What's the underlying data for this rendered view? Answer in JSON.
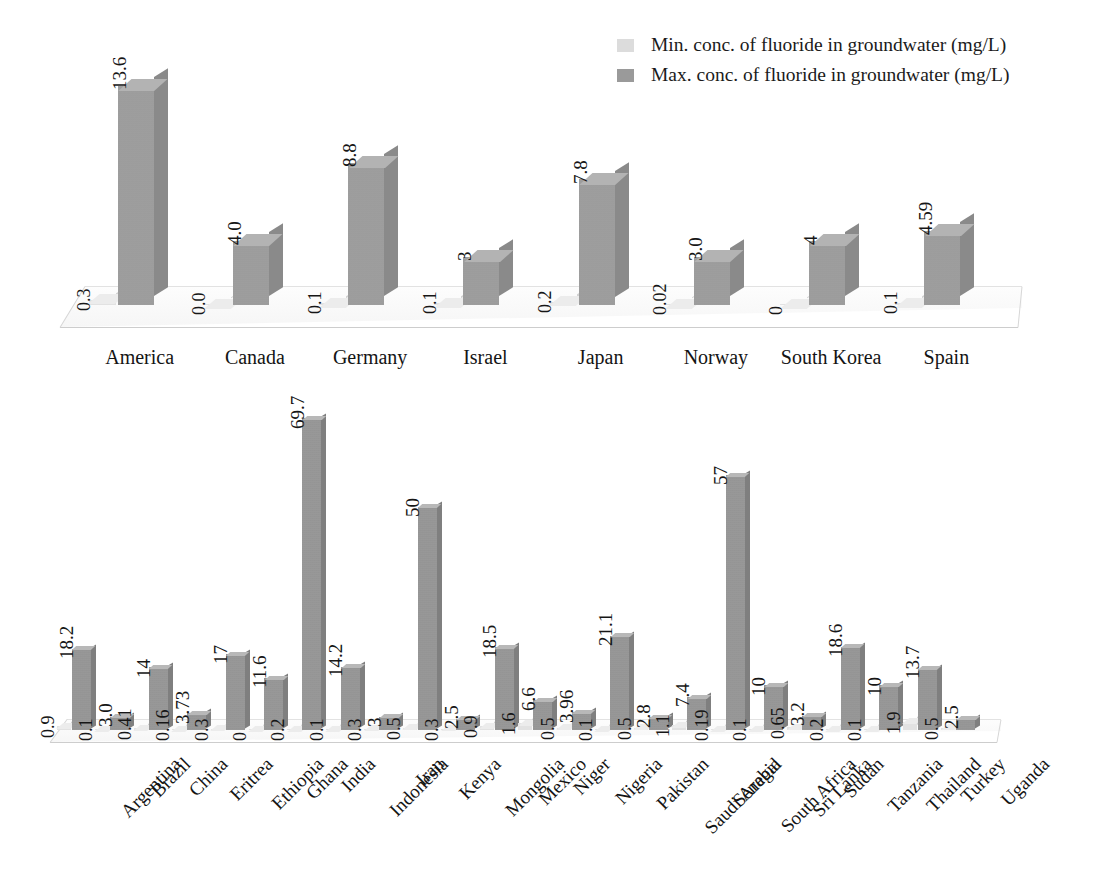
{
  "page": {
    "bleed_text": "",
    "background": "#ffffff"
  },
  "legend": {
    "position": "top-right",
    "items": [
      {
        "label": "Min. conc. of fluoride in groundwater (mg/L)",
        "color": "#dcdcdc",
        "key": "min"
      },
      {
        "label": "Max. conc. of fluoride in groundwater (mg/L)",
        "color": "#9a9a9a",
        "key": "max"
      }
    ]
  },
  "colors": {
    "bar_min": "#e2e2e2",
    "bar_max_front": "#9d9d9d",
    "bar_max_side": "#8a8a8a",
    "bar_max_top": "#b3b3b3",
    "floor": "#fbfbfb",
    "floor_edge": "#cfcfcf",
    "text": "#1a1a1a"
  },
  "chart_data": [
    {
      "id": "developed-countries",
      "type": "bar",
      "title": "",
      "xlabel": "",
      "ylabel": "",
      "grid": false,
      "axis_visible": false,
      "three_d": true,
      "legend_position": "top-right",
      "ylim": [
        0,
        14.5
      ],
      "categories": [
        "America",
        "Canada",
        "Germany",
        "Israel",
        "Japan",
        "Norway",
        "South Korea",
        "Spain"
      ],
      "series": [
        {
          "name": "Min. conc. of fluoride in groundwater (mg/L)",
          "values": [
            0.3,
            0.0,
            0.1,
            0.1,
            0.2,
            0.02,
            0,
            0.1
          ],
          "labels": [
            "0.3",
            "0.0",
            "0.1",
            "0.1",
            "0.2",
            "0.02",
            "0",
            "0.1"
          ]
        },
        {
          "name": "Max. conc. of fluoride in groundwater (mg/L)",
          "values": [
            13.6,
            4.0,
            8.8,
            3,
            7.8,
            3.0,
            4,
            4.59
          ],
          "labels": [
            "13.6",
            "4.0",
            "8.8",
            "3",
            "7.8",
            "3.0",
            "4",
            "4.59"
          ]
        }
      ]
    },
    {
      "id": "developing-countries",
      "type": "bar",
      "title": "",
      "xlabel": "",
      "ylabel": "",
      "grid": false,
      "axis_visible": false,
      "three_d": true,
      "legend_position": "none",
      "ylim": [
        0,
        72
      ],
      "categories": [
        "Argentina",
        "Brazil",
        "China",
        "Eritrea",
        "Ethiopia",
        "Ghana",
        "India",
        "Indonesia",
        "Iran",
        "Kenya",
        "Mongolia",
        "Mexico",
        "Niger",
        "Nigeria",
        "Pakistan",
        "Saudi Arabia",
        "Senegal",
        "South Africa",
        "Sri Lanka",
        "Sudan",
        "Tanzania",
        "Thailand",
        "Turkey",
        "Uganda"
      ],
      "series": [
        {
          "name": "Min. conc. of fluoride in groundwater (mg/L)",
          "values": [
            0.9,
            0.1,
            0.41,
            0.16,
            0.3,
            0,
            0.2,
            0.1,
            0.3,
            0.5,
            0.3,
            0.9,
            1.6,
            0.5,
            0.1,
            0.5,
            1.1,
            0.19,
            0.1,
            0.65,
            0.2,
            0.1,
            1.9,
            0.5
          ],
          "labels": [
            "0.9",
            "0.1",
            "0.41",
            "0.16",
            "0.3",
            "0",
            "0.2",
            "0.1",
            "0.3",
            "0.5",
            "0.3",
            "0.9",
            "1.6",
            "0.5",
            "0.1",
            "0.5",
            "1.1",
            "0.19",
            "0.1",
            "0.65",
            "0.2",
            "0.1",
            "1.9",
            "0.5"
          ]
        },
        {
          "name": "Max. conc. of fluoride in groundwater (mg/L)",
          "values": [
            18.2,
            3.0,
            14,
            3.73,
            17,
            11.6,
            69.7,
            14.2,
            3,
            50,
            2.5,
            18.5,
            6.6,
            3.96,
            21.1,
            2.8,
            7.4,
            57,
            10,
            3.2,
            18.6,
            10,
            13.7,
            2.5
          ],
          "labels": [
            "18.2",
            "3.0",
            "14",
            "3.73",
            "17",
            "11.6",
            "69.7",
            "14.2",
            "3",
            "50",
            "2.5",
            "18.5",
            "6.6",
            "3.96",
            "21.1",
            "2.8",
            "7.4",
            "57",
            "10",
            "3.2",
            "18.6",
            "10",
            "13.7",
            "2.5"
          ]
        }
      ]
    }
  ]
}
